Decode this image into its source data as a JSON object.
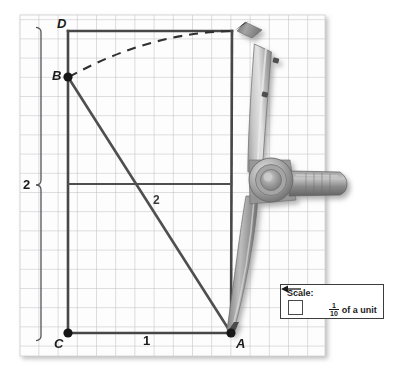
{
  "figure": {
    "paper": {
      "left": 20,
      "top": 15,
      "right": 325,
      "bottom": 356,
      "grid_cell_px": 19.2,
      "grid_color": "#b9b9bd",
      "paper_color": "#fdfdfd"
    },
    "vertices": [
      {
        "name": "A",
        "label": "A",
        "x": 231,
        "y": 333,
        "dot": true,
        "label_dx": 6,
        "label_dy": 4
      },
      {
        "name": "B",
        "label": "B",
        "x": 68,
        "y": 77,
        "dot": true,
        "label_dx": -14,
        "label_dy": -7
      },
      {
        "name": "C",
        "label": "C",
        "x": 68,
        "y": 333,
        "dot": true,
        "label_dx": -13,
        "label_dy": 4
      },
      {
        "name": "D",
        "label": "D",
        "x": 68,
        "y": 31,
        "dot": false,
        "label_dx": -3,
        "label_dy": -17
      }
    ],
    "edges": [
      {
        "name": "edge-D-to-topright",
        "from": [
          68,
          31
        ],
        "to": [
          232,
          31
        ]
      },
      {
        "name": "edge-D-to-C",
        "from": [
          68,
          31
        ],
        "to": [
          68,
          333
        ]
      },
      {
        "name": "edge-C-to-A",
        "from": [
          68,
          333
        ],
        "to": [
          231,
          333
        ]
      },
      {
        "name": "edge-topright-to-A",
        "from": [
          232,
          31
        ],
        "to": [
          231,
          333
        ]
      },
      {
        "name": "edge-B-to-A-diagonal",
        "from": [
          68,
          77
        ],
        "to": [
          231,
          333
        ]
      },
      {
        "name": "edge-midline-horizontal",
        "from": [
          68,
          184
        ],
        "to": [
          232,
          184
        ]
      }
    ],
    "arc": {
      "name": "compass-arc-B-to-topright",
      "from": [
        68,
        77
      ],
      "to": [
        232,
        31
      ],
      "control": [
        150,
        36
      ],
      "style": "dashed"
    },
    "measures": [
      {
        "name": "measure-height",
        "label": "2",
        "x": 28,
        "y": 185,
        "kind": "vertical-brace"
      },
      {
        "name": "measure-base",
        "label": "1",
        "x": 146,
        "y": 341,
        "kind": "horizontal"
      },
      {
        "name": "measure-diagonal",
        "label": "2",
        "x": 156,
        "y": 200,
        "kind": "diagonal"
      }
    ],
    "brace": {
      "name": "height-brace",
      "x": 41,
      "top": 31,
      "bottom": 337,
      "mid": 185,
      "tip_x": 36
    }
  },
  "scale_legend": {
    "name": "scale-legend",
    "title": "Scale:",
    "swatch_label": "grid-square-swatch",
    "arrow_label": "left-arrow-icon",
    "fraction_numerator": "1",
    "fraction_denominator": "10",
    "unit_text": "of a unit"
  },
  "compass": {
    "name": "compass-tool",
    "pivot": [
      271,
      180
    ],
    "pencil_tip": [
      236,
      32
    ],
    "needle_tip": [
      232,
      334
    ],
    "handle_end": [
      344,
      184
    ],
    "colors": {
      "metal_light": "#d2d2d2",
      "metal_mid": "#a9a9a9",
      "metal_dark": "#7d7d7d",
      "metal_darker": "#5e5e5e",
      "shadow": "#9b9b9b"
    }
  },
  "colors": {
    "ink": "#3d3d3d",
    "ink_dark": "#1b1b1b",
    "grid": "#b9b9bd",
    "paper": "#fdfdfd",
    "background": "#ffffff"
  }
}
